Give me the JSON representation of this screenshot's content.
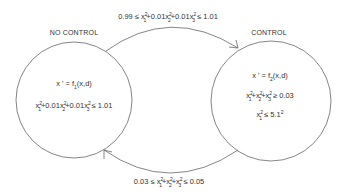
{
  "states": [
    {
      "id": "no-control",
      "title": "NO CONTROL",
      "dynamics": "x ' = f1(x,d)",
      "constraints": [
        "x1^2+0.01x2^2+0.01x3^2 ≤ 1.01"
      ]
    },
    {
      "id": "control",
      "title": "CONTROL",
      "dynamics": "x ' = f2(x,d)",
      "constraints": [
        "x1^2+x2^2+x3^2 ≥ 0.03",
        "x1^2 ≤ 5.1^2"
      ]
    }
  ],
  "transitions": [
    {
      "from": "NO CONTROL",
      "to": "CONTROL",
      "guard": "0.99 ≤ x1^2+0.01x2^2+0.01x3^2 ≤ 1.01"
    },
    {
      "from": "CONTROL",
      "to": "NO CONTROL",
      "guard": "0.03 ≤ x1^2+x2^2+x3^2 ≤ 0.05"
    }
  ],
  "colors": {
    "stroke": "#666666",
    "text": "#333333"
  }
}
